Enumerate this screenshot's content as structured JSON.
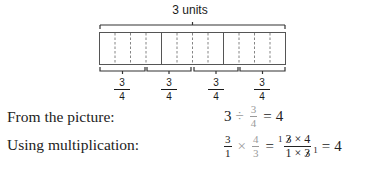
{
  "diagram": {
    "total_label": "3 units",
    "units": 3,
    "parts_per_unit": 4,
    "group_labels": [
      {
        "numerator": "3",
        "denominator": "4"
      },
      {
        "numerator": "3",
        "denominator": "4"
      },
      {
        "numerator": "3",
        "denominator": "4"
      },
      {
        "numerator": "3",
        "denominator": "4"
      }
    ]
  },
  "rows": [
    {
      "label": "From the picture:",
      "equation": {
        "lhs": "3",
        "op": "÷",
        "frac": {
          "numerator": "3",
          "denominator": "4"
        },
        "eq": "=",
        "result": "4"
      }
    },
    {
      "label": "Using multiplication:",
      "equation": {
        "frac1": {
          "numerator": "3",
          "denominator": "1"
        },
        "op": "×",
        "frac2": {
          "numerator": "4",
          "denominator": "3"
        },
        "eq": "=",
        "cancel_sup": "1",
        "combined": {
          "numerator_a": "3",
          "numerator_op": "× 4",
          "denominator_a": "1 ×",
          "denominator_b": "3"
        },
        "cancel_sub": "1",
        "eq2": "=",
        "result": "4"
      }
    }
  ],
  "colors": {
    "text": "#222222",
    "muted": "#9a9a9a",
    "lines": "#333333",
    "dashed": "#777777"
  }
}
